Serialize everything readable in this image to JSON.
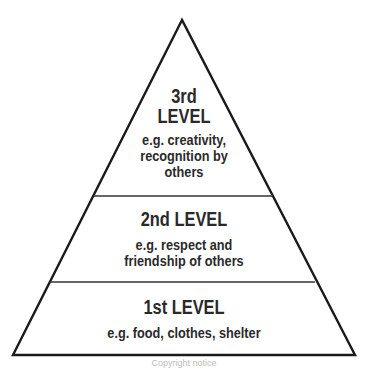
{
  "pyramid": {
    "levels": [
      {
        "title": "3rd",
        "title2": "LEVEL",
        "desc1": "e.g. creativity,",
        "desc2": "recognition by",
        "desc3": "others"
      },
      {
        "title": "2nd LEVEL",
        "desc1": "e.g. respect and",
        "desc2": "friendship of others"
      },
      {
        "title": "1st LEVEL",
        "desc1": "e.g. food, clothes, shelter"
      }
    ],
    "line_color": "#1a1a1a"
  },
  "caption": "Copyright notice"
}
